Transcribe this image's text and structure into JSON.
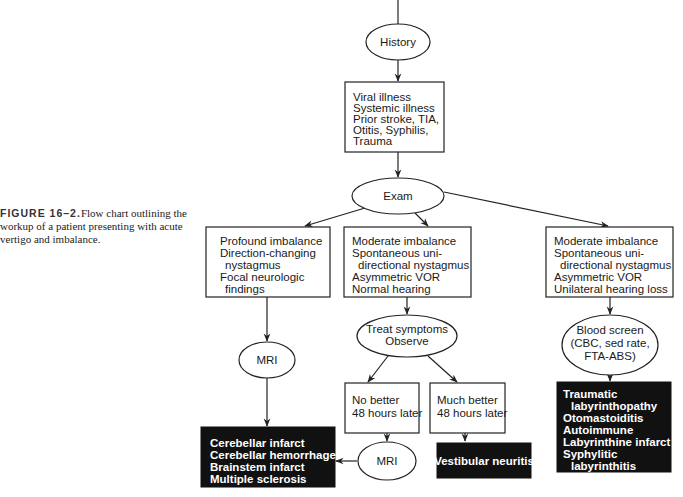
{
  "caption": {
    "label": "FIGURE 16–2.",
    "text": " Flow chart outlining the workup of a patient presenting with acute vertigo and imbalance."
  },
  "diagram": {
    "nodes": {
      "history": {
        "shape": "ellipse",
        "lines": [
          "History"
        ]
      },
      "history_box": {
        "shape": "box",
        "lines": [
          "Viral illness",
          "Systemic illness",
          "Prior stroke, TIA,",
          "Otitis, Syphilis,",
          "Trauma"
        ]
      },
      "exam": {
        "shape": "ellipse",
        "lines": [
          "Exam"
        ]
      },
      "central_findings": {
        "shape": "box",
        "lines": [
          "Profound imbalance",
          "Direction-changing",
          "  nystagmus",
          "Focal neurologic",
          "  findings"
        ]
      },
      "peripheral_findings": {
        "shape": "box",
        "lines": [
          "Moderate imbalance",
          "Spontaneous uni-",
          "  directional nystagmus",
          "Asymmetric VOR",
          "Normal hearing"
        ]
      },
      "hearing_loss_findings": {
        "shape": "box",
        "lines": [
          "Moderate imbalance",
          "Spontaneous uni-",
          "  directional nystagmus",
          "Asymmetric VOR",
          "Unilateral hearing loss"
        ]
      },
      "mri_left": {
        "shape": "ellipse",
        "lines": [
          "MRI"
        ]
      },
      "treat": {
        "shape": "ellipse",
        "lines": [
          "Treat symptoms",
          "Observe"
        ]
      },
      "blood_screen": {
        "shape": "ellipse",
        "lines": [
          "Blood screen",
          "(CBC, sed rate,",
          "FTA-ABS)"
        ]
      },
      "no_better": {
        "shape": "box",
        "lines": [
          "No better",
          "48 hours later"
        ]
      },
      "much_better": {
        "shape": "box",
        "lines": [
          "Much better",
          "48 hours later"
        ]
      },
      "mri_bottom": {
        "shape": "ellipse",
        "lines": [
          "MRI"
        ]
      },
      "central_dx": {
        "shape": "black-box",
        "lines": [
          "Cerebellar infarct",
          "Cerebellar hemorrhage",
          "Brainstem infarct",
          "Multiple sclerosis"
        ]
      },
      "vestibular_neuritis": {
        "shape": "black-box",
        "lines": [
          "Vestibular neuritis"
        ]
      },
      "labyrinth_dx": {
        "shape": "black-box",
        "lines": [
          "Traumatic",
          "  labyrinthopathy",
          "Otomastoiditis",
          "Autoimmune",
          "Labyrinthine infarct",
          "Syphylitic",
          "  labyrinthitis"
        ]
      }
    },
    "edges": [
      [
        "history",
        "history_box"
      ],
      [
        "history_box",
        "exam"
      ],
      [
        "exam",
        "central_findings"
      ],
      [
        "exam",
        "peripheral_findings"
      ],
      [
        "exam",
        "hearing_loss_findings"
      ],
      [
        "central_findings",
        "mri_left"
      ],
      [
        "mri_left",
        "central_dx"
      ],
      [
        "peripheral_findings",
        "treat"
      ],
      [
        "treat",
        "no_better"
      ],
      [
        "treat",
        "much_better"
      ],
      [
        "no_better",
        "mri_bottom"
      ],
      [
        "mri_bottom",
        "central_dx"
      ],
      [
        "much_better",
        "vestibular_neuritis"
      ],
      [
        "hearing_loss_findings",
        "blood_screen"
      ],
      [
        "blood_screen",
        "labyrinth_dx"
      ]
    ]
  }
}
